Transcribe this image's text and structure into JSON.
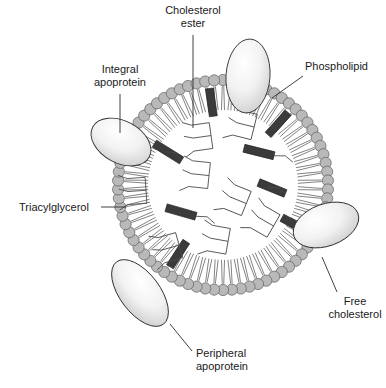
{
  "figure": {
    "background_color": "#ffffff"
  },
  "labels": [
    {
      "id": "cholesterol-ester",
      "line1": "Cholesterol",
      "line2": "ester",
      "text_x": 193,
      "text_y": 14,
      "anchor": "middle",
      "leader": "M 193 35 L 193 128",
      "target": "dark slab in the hydrophobic core"
    },
    {
      "id": "integral-apoprotein",
      "line1": "Integral",
      "line2": "apoprotein",
      "text_x": 120,
      "text_y": 73,
      "anchor": "middle",
      "leader": "M 120 94 L 120 133",
      "target": "ellipse spanning the phospholipid monolayer"
    },
    {
      "id": "phospholipid",
      "line1": "Phospholipid",
      "line2": "",
      "text_x": 305,
      "text_y": 70,
      "anchor": "start",
      "leader": "M 303 76 L 272 98",
      "target": "gray head group on the surface"
    },
    {
      "id": "triacylglycerol",
      "line1": "Triacylglycerol",
      "line2": "",
      "text_x": 19,
      "text_y": 211,
      "anchor": "start",
      "leader": "M 101 207 L 126 207",
      "target": "branched molecule in the core"
    },
    {
      "id": "free-cholesterol",
      "line1": "Free",
      "line2": "cholesterol",
      "text_x": 355,
      "text_y": 305,
      "anchor": "middle",
      "leader": "M 337 292 L 322 257",
      "target": "dark slab embedded in the monolayer"
    },
    {
      "id": "peripheral-apoprotein",
      "line1": "Peripheral",
      "line2": "apoprotein",
      "text_x": 196,
      "text_y": 357,
      "anchor": "start",
      "leader": "M 192 351 L 170 324",
      "target": "ellipse resting on the particle surface"
    }
  ],
  "structure": {
    "center_x": 223,
    "center_y": 185,
    "head_ring_radius": 105,
    "head_radius": 5.6,
    "tail_length": 24,
    "head_count": 74,
    "core_radius": 78
  },
  "colors": {
    "phospholipid_head_fill": "#b9b9b9",
    "phospholipid_head_stroke": "#5d5d5d",
    "phospholipid_tail": "#5a5a5a",
    "slab_fill": "#3b3b3b",
    "slab_stroke": "#1c1c1c",
    "apoprotein_fill_light": "#fbfbfb",
    "apoprotein_fill_mid": "#dddddd",
    "apoprotein_stroke": "#2e2e2e",
    "core_fill": "#ffffff",
    "text": "#1a1a1a"
  },
  "membrane_cholesterol": [
    {
      "id": "free-chol-upper-left",
      "angle_deg": 213,
      "length": 30,
      "width": 8
    },
    {
      "id": "free-chol-lower-left",
      "angle_deg": 119,
      "length": 30,
      "width": 8
    },
    {
      "id": "free-chol-right-upper",
      "angle_deg": 352,
      "length": 28,
      "width": 8
    },
    {
      "id": "free-chol-right-lower",
      "angle_deg": 42,
      "length": 30,
      "width": 8
    }
  ],
  "core_cholesterol_esters": [
    {
      "id": "ce-1",
      "x": 168,
      "y": 152,
      "angle_deg": 32,
      "length": 32,
      "width": 8,
      "tail_deg": 212,
      "tail_len": 18
    },
    {
      "id": "ce-2",
      "x": 259,
      "y": 152,
      "angle_deg": 14,
      "length": 31,
      "width": 8,
      "tail_deg": 16,
      "tail_len": 20
    },
    {
      "id": "ce-3",
      "x": 272,
      "y": 188,
      "angle_deg": 22,
      "length": 29,
      "width": 8,
      "tail_deg": 200,
      "tail_len": 18
    },
    {
      "id": "ce-4",
      "x": 181,
      "y": 212,
      "angle_deg": 16,
      "length": 31,
      "width": 8,
      "tail_deg": 18,
      "tail_len": 20
    }
  ],
  "core_triacylglycerols": [
    {
      "id": "tg-1",
      "x": 215,
      "y": 135,
      "rot_deg": -8
    },
    {
      "id": "tg-2",
      "x": 258,
      "y": 128,
      "rot_deg": 14
    },
    {
      "id": "tg-3",
      "x": 150,
      "y": 190,
      "rot_deg": -4
    },
    {
      "id": "tg-4",
      "x": 213,
      "y": 176,
      "rot_deg": 6
    },
    {
      "id": "tg-5",
      "x": 250,
      "y": 205,
      "rot_deg": 22
    },
    {
      "id": "tg-6",
      "x": 183,
      "y": 244,
      "rot_deg": -16
    },
    {
      "id": "tg-7",
      "x": 232,
      "y": 242,
      "rot_deg": 10
    },
    {
      "id": "tg-8",
      "x": 277,
      "y": 228,
      "rot_deg": 30
    }
  ],
  "apoproteins": [
    {
      "id": "apo-top-integral",
      "type": "integral",
      "cx": 248,
      "cy": 76,
      "rx": 22,
      "ry": 37,
      "rot_deg": 4
    },
    {
      "id": "apo-left-integral",
      "type": "integral",
      "cx": 121,
      "cy": 142,
      "rx": 32,
      "ry": 21,
      "rot_deg": 28
    },
    {
      "id": "apo-right-integral",
      "type": "integral",
      "cx": 326,
      "cy": 225,
      "rx": 34,
      "ry": 21,
      "rot_deg": -20
    },
    {
      "id": "apo-bottom-peripheral",
      "type": "peripheral",
      "cx": 140,
      "cy": 293,
      "rx": 39,
      "ry": 20,
      "rot_deg": 53
    }
  ]
}
